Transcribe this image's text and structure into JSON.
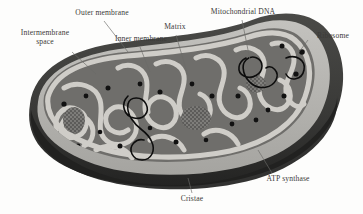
{
  "figure": {
    "background_color": "#fdfdfc"
  },
  "palette": {
    "outer_membrane": "#3d3d3b",
    "outer_membrane_shadow": "#262625",
    "intermembrane_space": "#b9b8b4",
    "inner_membrane": "#cfcdc8",
    "matrix": "#6f6e6b",
    "ribosome": "#111111",
    "dna": "#0d0d0d",
    "atp_synthase": "#8d8c88",
    "label_text": "#3b3a38",
    "leader_line": "#6b6a67"
  },
  "labels": {
    "outer_membrane": "Outer membrane",
    "intermembrane_space": "Intermembrane\nspace",
    "inner_membrane": "Inner membrane",
    "matrix": "Matrix",
    "mitochondrial_dna": "Mitochondrial DNA",
    "ribosome": "Ribosome",
    "atp_synthase": "ATP synthase",
    "cristae": "Cristae"
  },
  "structures": [
    {
      "id": "outer-membrane",
      "label": "Outer membrane",
      "description": "smooth dark outer boundary enclosing the organelle"
    },
    {
      "id": "intermembrane-space",
      "label": "Intermembrane space",
      "description": "pale gap between the outer and inner membranes"
    },
    {
      "id": "inner-membrane",
      "label": "Inner membrane",
      "description": "light folded membrane lining the matrix"
    },
    {
      "id": "matrix",
      "label": "Matrix",
      "description": "mid-gray interior compartment"
    },
    {
      "id": "cristae",
      "label": "Cristae",
      "description": "serpentine infoldings of the inner membrane"
    },
    {
      "id": "mitochondrial-dna",
      "label": "Mitochondrial DNA",
      "description": "black looping circular strands within the matrix"
    },
    {
      "id": "ribosome",
      "label": "Ribosome",
      "description": "small black dots scattered through the matrix"
    },
    {
      "id": "atp-synthase",
      "label": "ATP synthase",
      "description": "stippled particles studding the cristae surfaces"
    }
  ]
}
